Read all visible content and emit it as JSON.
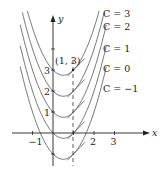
{
  "diagram": {
    "axes": {
      "x_label": "x",
      "y_label": "y",
      "x_ticks": [
        {
          "value": -1,
          "label": "−1"
        },
        {
          "value": 1,
          "label": ""
        },
        {
          "value": 2,
          "label": "2"
        },
        {
          "value": 3,
          "label": "3"
        }
      ],
      "y_ticks": [
        {
          "value": -1,
          "label": ""
        },
        {
          "value": 1,
          "label": "1"
        },
        {
          "value": 2,
          "label": "2"
        },
        {
          "value": 3,
          "label": "3"
        },
        {
          "value": 4,
          "label": ""
        }
      ]
    },
    "point": {
      "label": "(1, 3)",
      "x": 1,
      "y": 3
    },
    "dashed_line_x": 1,
    "curves": [
      {
        "C": 3,
        "label": "C = 3"
      },
      {
        "C": 2,
        "label": "C = 2"
      },
      {
        "C": 1,
        "label": "C = 1"
      },
      {
        "C": 0,
        "label": "C = 0"
      },
      {
        "C": -1,
        "label": "C = −1"
      }
    ],
    "colors": {
      "curve": "#555555",
      "axis": "#222222",
      "text": "#222222"
    }
  }
}
